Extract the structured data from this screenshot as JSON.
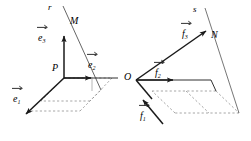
{
  "figure": {
    "type": "geometry-diagram",
    "stroke_color": "#1a1a1a",
    "dashed_color": "#8a8a8a",
    "background": "#ffffff"
  },
  "left_frame": {
    "origin_label": "P",
    "point_label": "M",
    "line_label": "r",
    "vectors": [
      {
        "base": "e",
        "index": "1",
        "label": "e1",
        "direction": "down-left"
      },
      {
        "base": "e",
        "index": "2",
        "label": "e2",
        "direction": "right"
      },
      {
        "base": "e",
        "index": "3",
        "label": "e3",
        "direction": "up"
      }
    ]
  },
  "right_frame": {
    "origin_label": "O",
    "point_label": "N",
    "line_label": "s",
    "vectors": [
      {
        "base": "f",
        "index": "1",
        "label": "f1",
        "direction": "down-left"
      },
      {
        "base": "f",
        "index": "2",
        "label": "f2",
        "direction": "right"
      },
      {
        "base": "f",
        "index": "3",
        "label": "f3",
        "direction": "up-right"
      }
    ]
  }
}
